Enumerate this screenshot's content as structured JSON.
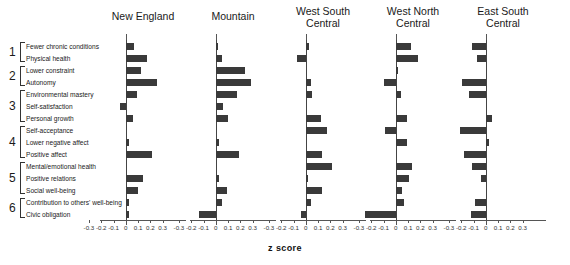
{
  "chart_data": {
    "type": "bar",
    "orientation": "horizontal",
    "title": "",
    "xlabel": "z score",
    "ylabel": "",
    "xlim": [
      -0.35,
      0.35
    ],
    "xticks": [
      -0.3,
      -0.2,
      -0.1,
      0,
      0.1,
      0.2,
      0.3
    ],
    "xticklabels": [
      "-0.3",
      "-0.2",
      "-0.1",
      "0",
      "0.1",
      "0.2",
      "0.3"
    ],
    "grid": false,
    "legend": "none",
    "categories": [
      "Fewer chronic conditions",
      "Physical health",
      "Lower constraint",
      "Autonomy",
      "Environmental mastery",
      "Self-satisfaction",
      "Personal growth",
      "Self-acceptance",
      "Lower negative affect",
      "Positive affect",
      "Mental/emotional health",
      "Positive relations",
      "Social well-being",
      "Contribution to others' well-being",
      "Civic obligation"
    ],
    "groups": [
      {
        "number": "1",
        "start": 0,
        "end": 1
      },
      {
        "number": "2",
        "start": 2,
        "end": 3
      },
      {
        "number": "3",
        "start": 4,
        "end": 6
      },
      {
        "number": "4",
        "start": 7,
        "end": 9
      },
      {
        "number": "5",
        "start": 10,
        "end": 12
      },
      {
        "number": "6",
        "start": 13,
        "end": 14
      }
    ],
    "series": [
      {
        "name": "New England",
        "values": [
          0.07,
          0.17,
          0.12,
          0.25,
          0.09,
          -0.05,
          0.06,
          0.0,
          0.03,
          0.21,
          0.0,
          0.14,
          0.1,
          0.03,
          0.03
        ]
      },
      {
        "name": "Mountain",
        "values": [
          0.02,
          0.05,
          0.24,
          0.29,
          0.17,
          0.06,
          0.1,
          0.0,
          0.03,
          0.19,
          0.0,
          0.03,
          0.09,
          0.05,
          -0.14
        ]
      },
      {
        "name": "West South Central",
        "values": [
          0.03,
          -0.07,
          0.0,
          0.04,
          0.05,
          0.0,
          0.12,
          0.17,
          0.0,
          0.13,
          0.21,
          0.02,
          0.13,
          0.04,
          -0.04
        ]
      },
      {
        "name": "West North Central",
        "values": [
          0.12,
          0.18,
          0.02,
          -0.1,
          0.04,
          0.0,
          0.09,
          -0.09,
          0.09,
          0.0,
          0.13,
          0.11,
          0.05,
          0.07,
          -0.25
        ]
      },
      {
        "name": "East South Central",
        "values": [
          -0.11,
          -0.07,
          0.0,
          -0.19,
          -0.14,
          0.0,
          0.05,
          -0.21,
          0.03,
          -0.18,
          -0.11,
          -0.04,
          0.0,
          -0.09,
          -0.12
        ]
      }
    ]
  },
  "panels": [
    {
      "label": "New England"
    },
    {
      "label": "Mountain"
    },
    {
      "label": "West South\nCentral"
    },
    {
      "label": "West North\nCentral"
    },
    {
      "label": "East South\nCentral"
    }
  ],
  "axis": {
    "xlabel": "z score"
  },
  "style": {
    "bar_color": "#3a3a3a",
    "axis_color": "#555555",
    "text_color": "#1a1a1a"
  }
}
